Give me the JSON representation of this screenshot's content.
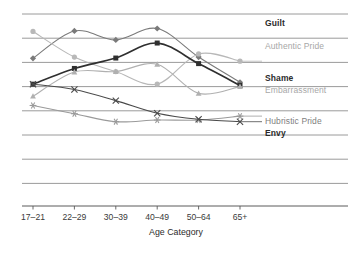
{
  "chart_data": {
    "type": "line",
    "title": "",
    "xlabel": "Age Category",
    "ylabel": "",
    "categories": [
      "17–21",
      "22–29",
      "30–39",
      "40–49",
      "50–64",
      "65+"
    ],
    "grid": true,
    "gridlines": 8,
    "legend": "right",
    "ylim": [
      0,
      8
    ],
    "series": [
      {
        "name": "Guilt",
        "color": "#7a7a7a",
        "marker": "diamond",
        "label_style": "dark",
        "values": [
          6.17,
          7.3,
          6.93,
          7.4,
          6.22,
          5.18
        ]
      },
      {
        "name": "Authentic Pride",
        "color": "#b8b8b8",
        "marker": "circle",
        "label_style": "gray",
        "values": [
          7.28,
          6.22,
          5.62,
          5.1,
          6.35,
          6.05
        ]
      },
      {
        "name": "Shame",
        "color": "#2f2f2f",
        "marker": "square",
        "label_style": "dark",
        "values": [
          5.1,
          5.75,
          6.18,
          6.8,
          5.95,
          5.05
        ]
      },
      {
        "name": "Embarrassment",
        "color": "#b0b0b0",
        "marker": "triangle",
        "label_style": "gray",
        "values": [
          4.6,
          5.6,
          5.62,
          5.92,
          4.72,
          5.0
        ]
      },
      {
        "name": "Hubristic Pride",
        "color": "#9a9a9a",
        "marker": "asterisk",
        "label_style": "mid",
        "values": [
          4.22,
          3.88,
          3.55,
          3.62,
          3.62,
          3.78
        ]
      },
      {
        "name": "Envy",
        "color": "#4a4a4a",
        "marker": "cross",
        "label_style": "dark",
        "values": [
          5.1,
          4.88,
          4.42,
          3.9,
          3.65,
          3.55
        ]
      }
    ]
  },
  "axis": {
    "x_tick_labels": [
      "17–21",
      "22–29",
      "30–39",
      "40–49",
      "50–64",
      "65+"
    ],
    "x_axis_title": "Age Category"
  },
  "legend": {
    "entries": [
      {
        "label": "Guilt"
      },
      {
        "label": "Authentic Pride"
      },
      {
        "label": "Shame"
      },
      {
        "label": "Embarrassment"
      },
      {
        "label": "Hubristic Pride"
      },
      {
        "label": "Envy"
      }
    ]
  },
  "colors": {
    "grid": "#8f8f8f",
    "axis": "#5a5a5a",
    "text_dark": "#2b2b2b",
    "text_gray": "#a7a7a7"
  }
}
